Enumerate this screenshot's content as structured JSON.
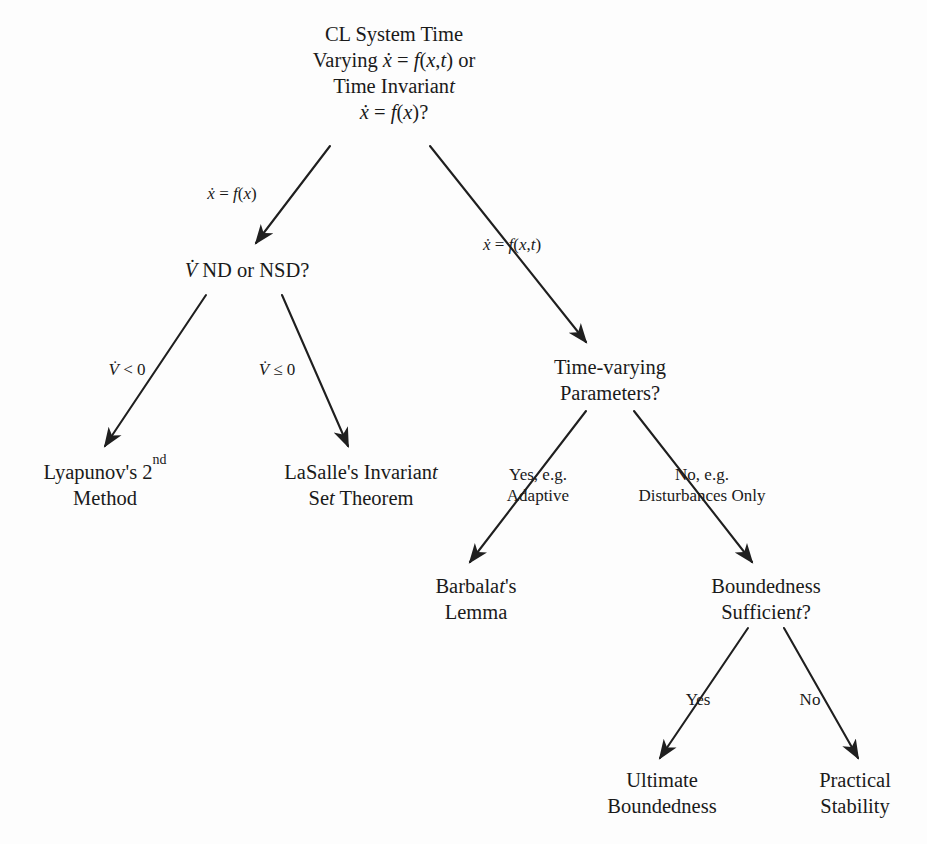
{
  "diagram": {
    "background_color": "#fdfdfd",
    "line_color": "#1f1f1f",
    "text_color": "#1a1a1a",
    "nodes": [
      {
        "id": "root",
        "name": "cl-system-time-varying-node",
        "lines": [
          "CL System Time",
          "Varying ẋ = f(x,t) or",
          "Time Invariant",
          "ẋ = f(x)?"
        ],
        "x": 394,
        "y": 75
      },
      {
        "id": "vdot-nd-nsd",
        "name": "vdot-nd-or-nsd-node",
        "lines": [
          "V̇ ND or NSD?"
        ],
        "x": 247,
        "y": 272
      },
      {
        "id": "time-varying-params",
        "name": "time-varying-parameters-node",
        "lines": [
          "Time-varying",
          "Parameters?"
        ],
        "x": 610,
        "y": 382
      },
      {
        "id": "lyapunov",
        "name": "lyapunov-second-method-node",
        "lines": [
          "Lyapunov's 2nd",
          "Method"
        ],
        "x": 105,
        "y": 487
      },
      {
        "id": "lasalle",
        "name": "lasalle-invariant-set-theorem-node",
        "lines": [
          "LaSalle's Invariant",
          "Set Theorem"
        ],
        "x": 361,
        "y": 487
      },
      {
        "id": "barbalat",
        "name": "barbalats-lemma-node",
        "lines": [
          "Barbalat's",
          "Lemma"
        ],
        "x": 476,
        "y": 601
      },
      {
        "id": "boundedness-sufficient",
        "name": "boundedness-sufficient-node",
        "lines": [
          "Boundedness",
          "Sufficient?"
        ],
        "x": 766,
        "y": 601
      },
      {
        "id": "ultimate-boundedness",
        "name": "ultimate-boundedness-node",
        "lines": [
          "Ultimate",
          "Boundedness"
        ],
        "x": 662,
        "y": 795
      },
      {
        "id": "practical-stability",
        "name": "practical-stability-node",
        "lines": [
          "Practical",
          "Stability"
        ],
        "x": 855,
        "y": 795
      }
    ],
    "edges": [
      {
        "id": "root-to-vdot",
        "name": "edge-root-to-vdot-nd-nsd",
        "from": "root",
        "to": "vdot-nd-nsd",
        "label_lines": [
          "ẋ = f(x)"
        ],
        "label_x": 232,
        "label_y": 195,
        "x1": 330,
        "y1": 146,
        "x2": 256,
        "y2": 243
      },
      {
        "id": "root-to-tvp",
        "name": "edge-root-to-time-varying-parameters",
        "from": "root",
        "to": "time-varying-params",
        "label_lines": [
          "ẋ = f(x,t)"
        ],
        "label_x": 512,
        "label_y": 246,
        "x1": 430,
        "y1": 146,
        "x2": 586,
        "y2": 342
      },
      {
        "id": "vdot-to-lyapunov",
        "name": "edge-vdot-to-lyapunov",
        "from": "vdot-nd-nsd",
        "to": "lyapunov",
        "label_lines": [
          "V̇ < 0"
        ],
        "label_x": 127,
        "label_y": 371,
        "x1": 206,
        "y1": 295,
        "x2": 105,
        "y2": 446
      },
      {
        "id": "vdot-to-lasalle",
        "name": "edge-vdot-to-lasalle",
        "from": "vdot-nd-nsd",
        "to": "lasalle",
        "label_lines": [
          "V̇ ≤ 0"
        ],
        "label_x": 277,
        "label_y": 371,
        "x1": 282,
        "y1": 295,
        "x2": 348,
        "y2": 446
      },
      {
        "id": "tvp-to-barbalat",
        "name": "edge-tvp-to-barbalat",
        "from": "time-varying-params",
        "to": "barbalat",
        "label_lines": [
          "Yes, e.g.",
          "Adaptive"
        ],
        "label_x": 538,
        "label_y": 486,
        "x1": 586,
        "y1": 411,
        "x2": 470,
        "y2": 562
      },
      {
        "id": "tvp-to-boundedness",
        "name": "edge-tvp-to-boundedness-sufficient",
        "from": "time-varying-params",
        "to": "boundedness-sufficient",
        "label_lines": [
          "No, e.g.",
          "Disturbances Only"
        ],
        "label_x": 702,
        "label_y": 486,
        "x1": 634,
        "y1": 411,
        "x2": 752,
        "y2": 562
      },
      {
        "id": "bs-to-ultimate",
        "name": "edge-boundedness-to-ultimate-boundedness",
        "from": "boundedness-sufficient",
        "to": "ultimate-boundedness",
        "label_lines": [
          "Yes"
        ],
        "label_x": 698,
        "label_y": 701,
        "x1": 748,
        "y1": 628,
        "x2": 660,
        "y2": 758
      },
      {
        "id": "bs-to-practical",
        "name": "edge-boundedness-to-practical-stability",
        "from": "boundedness-sufficient",
        "to": "practical-stability",
        "label_lines": [
          "No"
        ],
        "label_x": 810,
        "label_y": 701,
        "x1": 784,
        "y1": 628,
        "x2": 858,
        "y2": 758
      }
    ]
  }
}
